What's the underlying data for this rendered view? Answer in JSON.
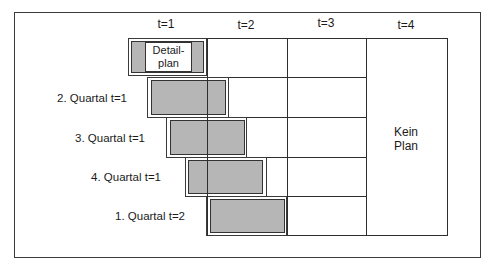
{
  "diagram": {
    "type": "rolling-planning-schema",
    "columns": [
      {
        "label": "t=1"
      },
      {
        "label": "t=2"
      },
      {
        "label": "t=3"
      },
      {
        "label": "t=4"
      }
    ],
    "rows": [
      {
        "label": "",
        "box": "Detail-plan"
      },
      {
        "label": "2. Quartal t=1"
      },
      {
        "label": "3. Quartal t=1"
      },
      {
        "label": "4. Quartal t=1"
      },
      {
        "label": "1. Quartal t=2"
      }
    ],
    "detail_box": {
      "line1": "Detail-",
      "line2": "plan"
    },
    "no_plan": {
      "line1": "Kein",
      "line2": "Plan"
    },
    "colors": {
      "fill": "#b6b6b6",
      "line": "#2e2e2e",
      "background": "#ffffff"
    }
  }
}
